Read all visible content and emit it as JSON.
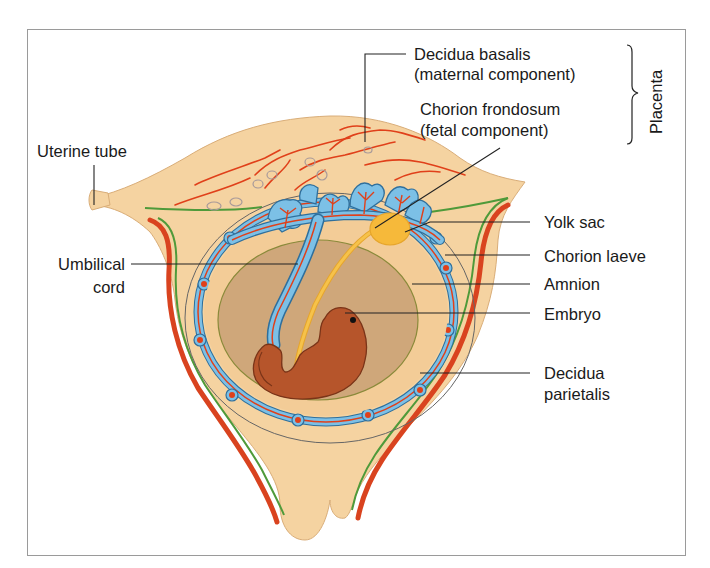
{
  "figure": {
    "type": "anatomical-diagram"
  },
  "labels": {
    "decidua_basalis": [
      "Decidua basalis",
      "(maternal component)"
    ],
    "chorion_frondosum": [
      "Chorion frondosum",
      "(fetal component)"
    ],
    "placenta": "Placenta",
    "uterine_tube": "Uterine tube",
    "umbilical_cord": [
      "Umbilical",
      "cord"
    ],
    "yolk_sac": "Yolk sac",
    "chorion_laeve": "Chorion laeve",
    "amnion": "Amnion",
    "embryo": "Embryo",
    "decidua_parietalis": [
      "Decidua",
      "parietalis"
    ]
  },
  "colors": {
    "frame": "#9a9a9a",
    "uterine_wall": "#f5d3a1",
    "uterine_wall_outline": "#d9ad78",
    "myometrium_red": "#d9431f",
    "endometrium_green": "#4f9a3a",
    "chorion_blue": "#7cc0e6",
    "chorion_blue_outline": "#2f6f9c",
    "vessel_red": "#e0401a",
    "amniotic_cavity": "#cfa77a",
    "yolk_sac": "#f6b93a",
    "embryo": "#b6552b",
    "embryo_outline": "#7a3418",
    "gland_outline": "#a89a9a"
  }
}
